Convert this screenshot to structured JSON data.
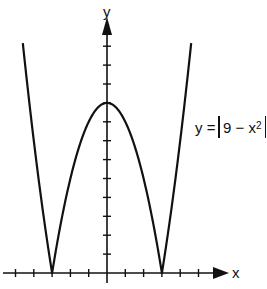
{
  "chart_data": {
    "type": "line",
    "title": "",
    "equation_label": {
      "lhs": "y =",
      "body": "9 − x",
      "exponent": "2"
    },
    "xlabel": "x",
    "ylabel": "y",
    "function": "y = |9 - x^2|",
    "xlim": [
      -5.8,
      8.5
    ],
    "ylim": [
      -0.6,
      13.5
    ],
    "x_ticks": [
      -5,
      -4,
      -3,
      -2,
      -1,
      1,
      2,
      3,
      4,
      5
    ],
    "y_ticks": [
      1,
      2,
      3,
      4,
      5,
      6,
      7,
      8,
      9,
      10,
      11,
      12
    ],
    "tick_labels_shown": false,
    "grid": false,
    "legend": null,
    "series": [
      {
        "name": "y = |9 - x^2|",
        "x": [
          -4.6,
          -4,
          -3.5,
          -3,
          -2.5,
          -2,
          -1.5,
          -1,
          -0.5,
          0,
          0.5,
          1,
          1.5,
          2,
          2.5,
          3,
          3.5,
          4,
          4.6
        ],
        "values": [
          12.16,
          7,
          3.25,
          0,
          2.75,
          5,
          6.75,
          8,
          8.75,
          9,
          8.75,
          8,
          6.75,
          5,
          2.75,
          0,
          3.25,
          7,
          12.16
        ]
      }
    ],
    "key_points": {
      "vertex_max": [
        0,
        9
      ],
      "zeros": [
        [
          -3,
          0
        ],
        [
          3,
          0
        ]
      ]
    },
    "colors": {
      "curve": "#111111",
      "axes": "#111111",
      "background": "#ffffff"
    }
  },
  "labels": {
    "x_axis": "x",
    "y_axis": "y",
    "equation_lhs": "y =",
    "equation_body": "9 − x",
    "equation_exp": "2"
  }
}
